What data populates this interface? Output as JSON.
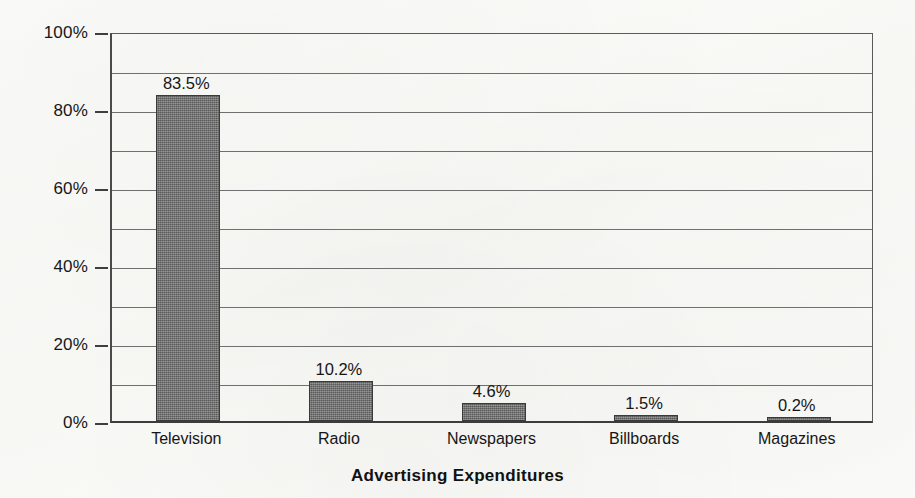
{
  "chart_data": {
    "type": "bar",
    "title": "Advertising Expenditures",
    "subtitle": "",
    "xlabel": "",
    "ylabel": "",
    "categories": [
      "Television",
      "Radio",
      "Newspapers",
      "Billboards",
      "Magazines"
    ],
    "values": [
      83.5,
      10.2,
      4.6,
      1.5,
      0.2
    ],
    "value_labels": [
      "83.5%",
      "10.2%",
      "4.6%",
      "1.5%",
      "0.2%"
    ],
    "ylim": [
      0,
      100
    ],
    "y_tick_labels": [
      "0%",
      "20%",
      "40%",
      "60%",
      "80%",
      "100%"
    ],
    "y_tick_values": [
      0,
      20,
      40,
      60,
      80,
      100
    ],
    "gridline_values": [
      10,
      20,
      30,
      40,
      50,
      60,
      70,
      80,
      90,
      100
    ],
    "grid": true,
    "legend": "none",
    "bar_color": "#6e6e6e",
    "bar_border_color": "#3a3a3a",
    "axis_color": "#3f3f3f",
    "grid_color": "#6f6f6f",
    "text_color": "#161616",
    "background_color": "#fbfbf9",
    "units": "percent"
  }
}
